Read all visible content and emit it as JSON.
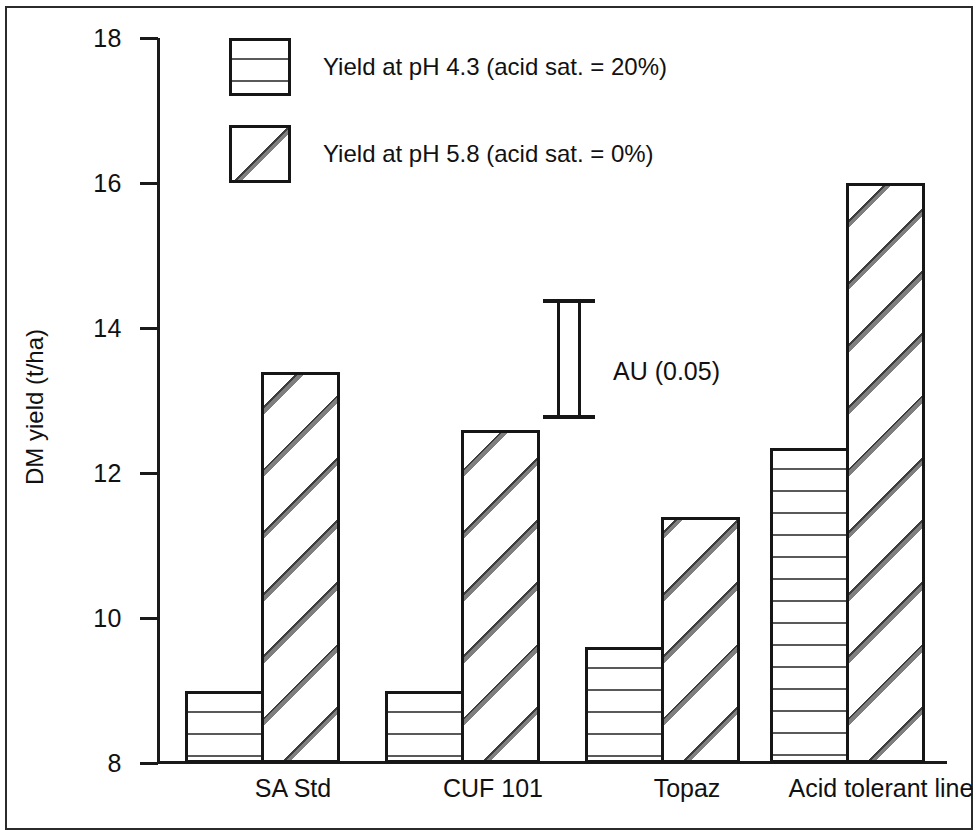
{
  "chart_data": {
    "type": "bar",
    "title": "",
    "xlabel": "",
    "ylabel": "DM yield (t/ha)",
    "ylim": [
      8,
      18
    ],
    "yticks": [
      8,
      10,
      12,
      14,
      16,
      18
    ],
    "grid": false,
    "legend_position": "top-left",
    "categories": [
      "SA Std",
      "CUF 101",
      "Topaz",
      "Acid tolerant line"
    ],
    "series": [
      {
        "name": "Yield at pH 4.3 (acid sat. = 20%)",
        "pattern": "horizontal-lines",
        "values": [
          9.0,
          9.0,
          9.6,
          12.35
        ]
      },
      {
        "name": "Yield at pH 5.8 (acid sat. = 0%)",
        "pattern": "diagonal-hatch",
        "values": [
          13.4,
          12.6,
          11.4,
          16.0
        ]
      }
    ],
    "annotations": [
      {
        "label": "AU (0.05)",
        "type": "error-bar",
        "y_top": 14.4,
        "y_bottom": 12.75
      }
    ]
  },
  "axis": {
    "y_title": "DM yield (t/ha)",
    "y_tick_labels": [
      "18",
      "16",
      "14",
      "12",
      "10",
      "8"
    ],
    "x_tick_labels": [
      "SA Std",
      "CUF 101",
      "Topaz",
      "Acid tolerant line"
    ]
  },
  "legend": {
    "items": [
      {
        "label": "Yield at pH 4.3 (acid sat. = 20%)"
      },
      {
        "label": "Yield at pH 5.8 (acid sat. = 0%)"
      }
    ]
  },
  "annotation": {
    "error_bar_label": "AU (0.05)"
  },
  "colors": {
    "ink": "#161616",
    "background": "#ffffff",
    "hatch": "#787878"
  }
}
